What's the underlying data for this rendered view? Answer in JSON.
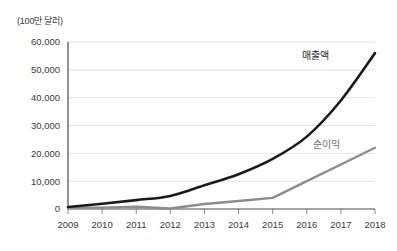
{
  "unit_label": "(100만 달러)",
  "annotations": {
    "revenue": "매출액",
    "net_profit": "순이익"
  },
  "chart_data": {
    "type": "line",
    "title": "",
    "subtitle": "",
    "xlabel": "",
    "ylabel": "(100만 달러)",
    "categories": [
      "2009",
      "2010",
      "2011",
      "2012",
      "2013",
      "2014",
      "2015",
      "2016",
      "2017",
      "2018"
    ],
    "x": [
      2009,
      2010,
      2011,
      2012,
      2013,
      2014,
      2015,
      2016,
      2017,
      2018
    ],
    "series": [
      {
        "name": "매출액",
        "color": "#1a1a1a",
        "values": [
          700,
          1900,
          3200,
          4700,
          8500,
          12500,
          18000,
          26000,
          39000,
          56000
        ]
      },
      {
        "name": "순이익",
        "color": "#8c8c8c",
        "values": [
          500,
          500,
          800,
          200,
          1800,
          2900,
          4000,
          10000,
          16000,
          22000
        ]
      }
    ],
    "ylim": [
      0,
      60000
    ],
    "yticks": [
      0,
      10000,
      20000,
      30000,
      40000,
      50000,
      60000
    ],
    "ytick_labels": [
      "0",
      "10,000",
      "20,000",
      "30,000",
      "40,000",
      "50,000",
      "60,000"
    ],
    "grid": true,
    "grid_axis": "y",
    "legend": "inline-annotations",
    "legend_position": "none"
  },
  "colors": {
    "revenue_line": "#1a1a1a",
    "profit_line": "#8c8c8c",
    "gridline": "#e4e4e4",
    "axis": "#4a4a4a",
    "background": "#ffffff",
    "text": "#3a3a3a"
  }
}
